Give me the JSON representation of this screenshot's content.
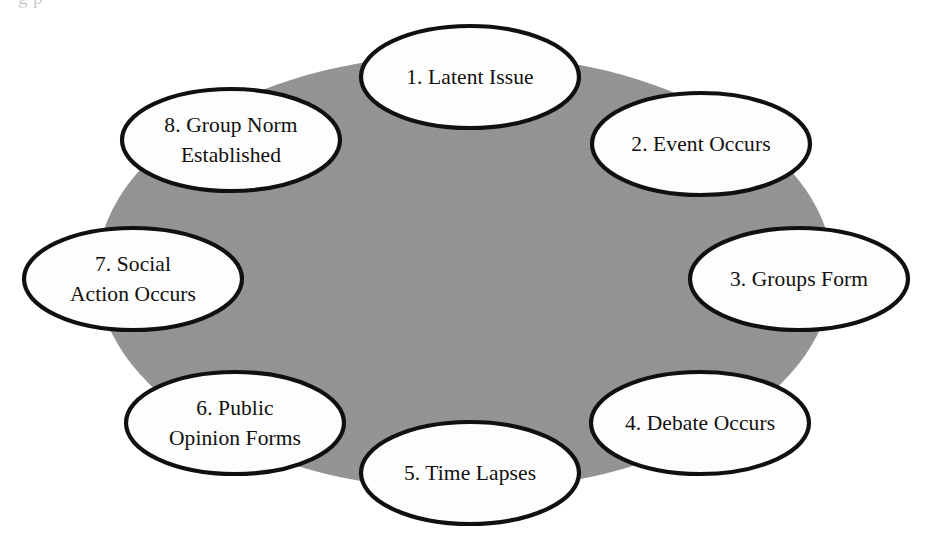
{
  "figure": {
    "type": "cycle-diagram",
    "background_color": "#ffffff",
    "backdrop_color": "#969696",
    "node_fill_color": "#fdfdfd",
    "node_stroke_color": "#101010",
    "text_color": "#12100f",
    "clipped_top_text": "g  p"
  },
  "backdrop": {
    "shape": "ellipse",
    "cx": 465,
    "cy": 272,
    "rx": 368,
    "ry": 218
  },
  "nodes": [
    {
      "id": 1,
      "number": "1.",
      "label": "1. Latent Issue",
      "lines": [
        "1. Latent Issue"
      ],
      "cx": 470,
      "cy": 77,
      "rx": 109,
      "ry": 51
    },
    {
      "id": 2,
      "number": "2.",
      "label": "2. Event Occurs",
      "lines": [
        "2. Event Occurs"
      ],
      "cx": 701,
      "cy": 144,
      "rx": 109,
      "ry": 51
    },
    {
      "id": 3,
      "number": "3.",
      "label": "3. Groups Form",
      "lines": [
        "3. Groups Form"
      ],
      "cx": 799,
      "cy": 279,
      "rx": 109,
      "ry": 51
    },
    {
      "id": 4,
      "number": "4.",
      "label": "4. Debate Occurs",
      "lines": [
        "4. Debate Occurs"
      ],
      "cx": 700,
      "cy": 423,
      "rx": 109,
      "ry": 51
    },
    {
      "id": 5,
      "number": "5.",
      "label": "5. Time Lapses",
      "lines": [
        "5. Time Lapses"
      ],
      "cx": 470,
      "cy": 473,
      "rx": 109,
      "ry": 51
    },
    {
      "id": 6,
      "number": "6.",
      "label": "6. Public Opinion Forms",
      "lines": [
        "6. Public",
        "Opinion Forms"
      ],
      "cx": 235,
      "cy": 423,
      "rx": 109,
      "ry": 51
    },
    {
      "id": 7,
      "number": "7.",
      "label": "7. Social Action Occurs",
      "lines": [
        "7. Social",
        "Action Occurs"
      ],
      "cx": 133,
      "cy": 279,
      "rx": 109,
      "ry": 51
    },
    {
      "id": 8,
      "number": "8.",
      "label": "8. Group Norm Established",
      "lines": [
        "8. Group Norm",
        "Established"
      ],
      "cx": 231,
      "cy": 140,
      "rx": 109,
      "ry": 51
    }
  ]
}
